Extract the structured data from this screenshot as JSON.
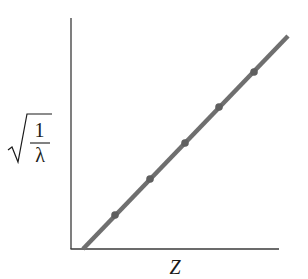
{
  "chart_data": {
    "type": "line",
    "title": "",
    "xlabel": "Z",
    "ylabel": "√(1/λ)",
    "ylabel_parts": {
      "radical": "√",
      "numerator": "1",
      "denominator": "λ"
    },
    "grid": false,
    "legend": null,
    "x_ticks": [],
    "y_ticks": [],
    "note": "Moseley's law: square root of inverse wavelength is linear in atomic number Z; no numeric axis scales shown",
    "x_range_px": [
      71,
      279
    ],
    "y_range_px": [
      249,
      18
    ],
    "line": {
      "x1": 83,
      "y1": 249,
      "x2": 288,
      "y2": 36
    },
    "series": [
      {
        "name": "data points",
        "points": [
          {
            "x": 115,
            "y": 215
          },
          {
            "x": 150,
            "y": 179
          },
          {
            "x": 185,
            "y": 143
          },
          {
            "x": 219,
            "y": 107
          },
          {
            "x": 254,
            "y": 72
          }
        ]
      }
    ],
    "colors": {
      "line": "#6f6f6f",
      "points": "#5f5f5f",
      "axes": "#3a3a3a"
    }
  }
}
